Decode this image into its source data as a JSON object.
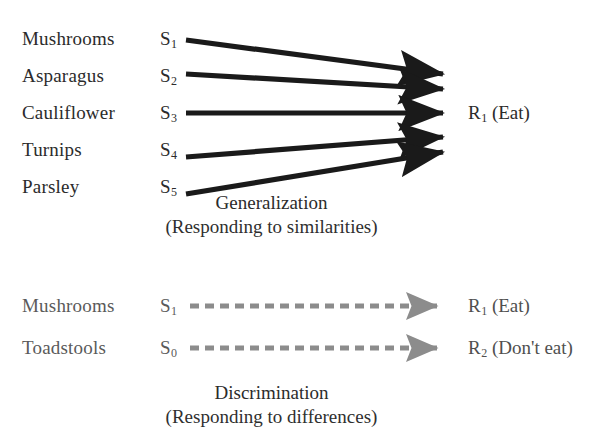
{
  "diagram": {
    "title_visible": false,
    "colors": {
      "solid_arrow": "#1a1a1a",
      "dashed_arrow": "#8c8c8c",
      "text_dark": "#2b2b2b",
      "text_gray": "#5a5a5a",
      "background": "#ffffff"
    }
  },
  "generalization": {
    "caption": "Generalization",
    "subcaption": "(Responding to similarities)",
    "rows": [
      {
        "stimulus_name": "Mushrooms",
        "stimulus_code": "S",
        "stimulus_sub": "1"
      },
      {
        "stimulus_name": "Asparagus",
        "stimulus_code": "S",
        "stimulus_sub": "2"
      },
      {
        "stimulus_name": "Cauliflower",
        "stimulus_code": "S",
        "stimulus_sub": "3"
      },
      {
        "stimulus_name": "Turnips",
        "stimulus_code": "S",
        "stimulus_sub": "4"
      },
      {
        "stimulus_name": "Parsley",
        "stimulus_code": "S",
        "stimulus_sub": "5"
      }
    ],
    "response": {
      "code": "R",
      "sub": "1",
      "text": "(Eat)"
    }
  },
  "discrimination": {
    "caption": "Discrimination",
    "subcaption": "(Responding to differences)",
    "rows": [
      {
        "stimulus_name": "Mushrooms",
        "stimulus_code": "S",
        "stimulus_sub": "1",
        "response_code": "R",
        "response_sub": "1",
        "response_text": "(Eat)"
      },
      {
        "stimulus_name": "Toadstools",
        "stimulus_code": "S",
        "stimulus_sub": "0",
        "response_code": "R",
        "response_sub": "2",
        "response_text": "(Don't eat)"
      }
    ]
  }
}
